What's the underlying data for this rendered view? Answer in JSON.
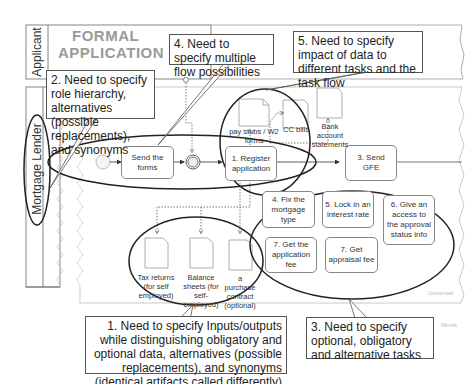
{
  "pool": {
    "title_line1": "FORMAL",
    "title_line2": "APPLICATION",
    "lanes": [
      {
        "label": "Applicant"
      },
      {
        "label": "Mortgage Lender"
      }
    ]
  },
  "tasks": {
    "send_forms": "Send the forms",
    "register": "1. Register application",
    "send_gfe": "3. Send GFE",
    "fix_type": "4. Fix the mortgage type",
    "lock_rate": "5. Lock in an interest rate",
    "give_access": "6. Give an access to the approval status info",
    "app_fee": "7. Get the application fee",
    "appraisal_fee": "7. Get appraisal fee"
  },
  "documents": {
    "pay_stubs": "pay stubs / W2 forms",
    "cc_bills": "CC bills",
    "bank_statements": "Bank account statements",
    "tax_returns": "Tax returns (for self employed)",
    "balance_sheets": "Balance sheets (for self-employed)",
    "purchase_contract": "a purchase contract (optional)"
  },
  "callouts": {
    "c1": "1. Need to specify Inputs/outputs while distinguishing obligatory and optional data, alternatives (possible replacements), and synonyms (identical artifacts called differently)",
    "c2": "2. Need to specify role hierarchy, alternatives (possible replacements), and synonyms",
    "c3": "3. Need to specify optional, obligatory and alternative tasks",
    "c4": "4. Need to specify multiple flow possibilities",
    "c5": "5. Need to specify impact of data to different tasks and the task flow"
  },
  "watermarks": {
    "w1": "Universal",
    "w2": "Minds"
  }
}
